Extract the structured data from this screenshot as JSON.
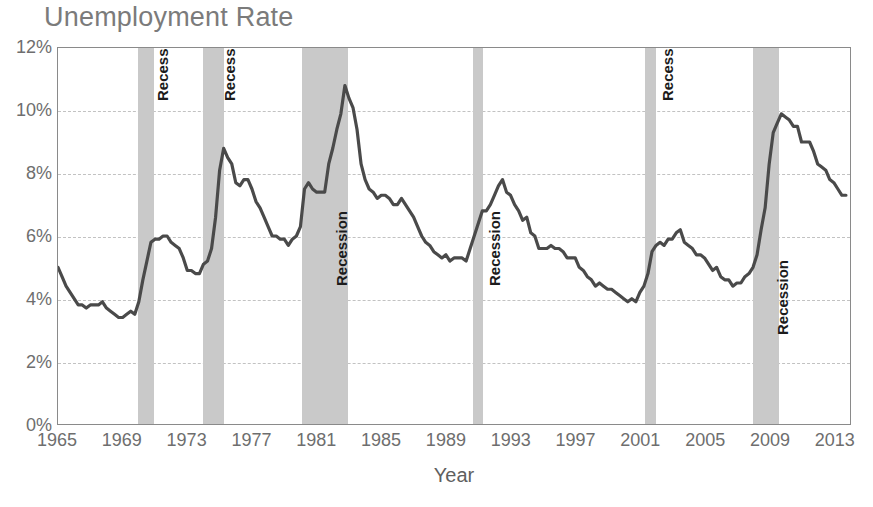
{
  "chart_data": {
    "type": "line",
    "title": "Unemployment Rate",
    "xlabel": "Year",
    "ylabel": "",
    "xlim": [
      1965,
      2014
    ],
    "ylim": [
      0,
      12
    ],
    "grid": true,
    "legend": "none",
    "y_tick_labels": [
      "0%",
      "2%",
      "4%",
      "6%",
      "8%",
      "10%",
      "12%"
    ],
    "y_tick_values": [
      0,
      2,
      4,
      6,
      8,
      10,
      12
    ],
    "x_tick_labels": [
      "1965",
      "1969",
      "1973",
      "1977",
      "1981",
      "1985",
      "1989",
      "1993",
      "1997",
      "2001",
      "2005",
      "2009",
      "2013"
    ],
    "x_tick_values": [
      1965,
      1969,
      1973,
      1977,
      1981,
      1985,
      1989,
      1993,
      1997,
      2001,
      2005,
      2009,
      2013
    ],
    "series": [
      {
        "name": "Unemployment Rate",
        "color": "#4a4a4a",
        "units": "percent",
        "x": [
          1965.0,
          1965.25,
          1965.5,
          1965.75,
          1966.0,
          1966.25,
          1966.5,
          1966.75,
          1967.0,
          1967.25,
          1967.5,
          1967.75,
          1968.0,
          1968.25,
          1968.5,
          1968.75,
          1969.0,
          1969.25,
          1969.5,
          1969.75,
          1970.0,
          1970.25,
          1970.5,
          1970.75,
          1971.0,
          1971.25,
          1971.5,
          1971.75,
          1972.0,
          1972.25,
          1972.5,
          1972.75,
          1973.0,
          1973.25,
          1973.5,
          1973.75,
          1974.0,
          1974.25,
          1974.5,
          1974.75,
          1975.0,
          1975.25,
          1975.5,
          1975.75,
          1976.0,
          1976.25,
          1976.5,
          1976.75,
          1977.0,
          1977.25,
          1977.5,
          1977.75,
          1978.0,
          1978.25,
          1978.5,
          1978.75,
          1979.0,
          1979.25,
          1979.5,
          1979.75,
          1980.0,
          1980.25,
          1980.5,
          1980.75,
          1981.0,
          1981.25,
          1981.5,
          1981.75,
          1982.0,
          1982.25,
          1982.5,
          1982.75,
          1983.0,
          1983.25,
          1983.5,
          1983.75,
          1984.0,
          1984.25,
          1984.5,
          1984.75,
          1985.0,
          1985.25,
          1985.5,
          1985.75,
          1986.0,
          1986.25,
          1986.5,
          1986.75,
          1987.0,
          1987.25,
          1987.5,
          1987.75,
          1988.0,
          1988.25,
          1988.5,
          1988.75,
          1989.0,
          1989.25,
          1989.5,
          1989.75,
          1990.0,
          1990.25,
          1990.5,
          1990.75,
          1991.0,
          1991.25,
          1991.5,
          1991.75,
          1992.0,
          1992.25,
          1992.5,
          1992.75,
          1993.0,
          1993.25,
          1993.5,
          1993.75,
          1994.0,
          1994.25,
          1994.5,
          1994.75,
          1995.0,
          1995.25,
          1995.5,
          1995.75,
          1996.0,
          1996.25,
          1996.5,
          1996.75,
          1997.0,
          1997.25,
          1997.5,
          1997.75,
          1998.0,
          1998.25,
          1998.5,
          1998.75,
          1999.0,
          1999.25,
          1999.5,
          1999.75,
          2000.0,
          2000.25,
          2000.5,
          2000.75,
          2001.0,
          2001.25,
          2001.5,
          2001.75,
          2002.0,
          2002.25,
          2002.5,
          2002.75,
          2003.0,
          2003.25,
          2003.5,
          2003.75,
          2004.0,
          2004.25,
          2004.5,
          2004.75,
          2005.0,
          2005.25,
          2005.5,
          2005.75,
          2006.0,
          2006.25,
          2006.5,
          2006.75,
          2007.0,
          2007.25,
          2007.5,
          2007.75,
          2008.0,
          2008.25,
          2008.5,
          2008.75,
          2009.0,
          2009.25,
          2009.5,
          2009.75,
          2010.0,
          2010.25,
          2010.5,
          2010.75,
          2011.0,
          2011.25,
          2011.5,
          2011.75,
          2012.0,
          2012.25,
          2012.5,
          2012.75,
          2013.0,
          2013.25,
          2013.5,
          2013.75
        ],
        "y": [
          5.0,
          4.7,
          4.4,
          4.2,
          4.0,
          3.8,
          3.8,
          3.7,
          3.8,
          3.8,
          3.8,
          3.9,
          3.7,
          3.6,
          3.5,
          3.4,
          3.4,
          3.5,
          3.6,
          3.5,
          3.9,
          4.6,
          5.2,
          5.8,
          5.9,
          5.9,
          6.0,
          6.0,
          5.8,
          5.7,
          5.6,
          5.3,
          4.9,
          4.9,
          4.8,
          4.8,
          5.1,
          5.2,
          5.6,
          6.6,
          8.1,
          8.8,
          8.5,
          8.3,
          7.7,
          7.6,
          7.8,
          7.8,
          7.5,
          7.1,
          6.9,
          6.6,
          6.3,
          6.0,
          6.0,
          5.9,
          5.9,
          5.7,
          5.9,
          6.0,
          6.3,
          7.5,
          7.7,
          7.5,
          7.4,
          7.4,
          7.4,
          8.3,
          8.8,
          9.4,
          9.9,
          10.8,
          10.4,
          10.1,
          9.4,
          8.3,
          7.8,
          7.5,
          7.4,
          7.2,
          7.3,
          7.3,
          7.2,
          7.0,
          7.0,
          7.2,
          7.0,
          6.8,
          6.6,
          6.3,
          6.0,
          5.8,
          5.7,
          5.5,
          5.4,
          5.3,
          5.4,
          5.2,
          5.3,
          5.3,
          5.3,
          5.2,
          5.6,
          6.0,
          6.4,
          6.8,
          6.8,
          7.0,
          7.3,
          7.6,
          7.8,
          7.4,
          7.3,
          7.0,
          6.8,
          6.5,
          6.6,
          6.1,
          6.0,
          5.6,
          5.6,
          5.6,
          5.7,
          5.6,
          5.6,
          5.5,
          5.3,
          5.3,
          5.3,
          5.0,
          4.9,
          4.7,
          4.6,
          4.4,
          4.5,
          4.4,
          4.3,
          4.3,
          4.2,
          4.1,
          4.0,
          3.9,
          4.0,
          3.9,
          4.2,
          4.4,
          4.8,
          5.5,
          5.7,
          5.8,
          5.7,
          5.9,
          5.9,
          6.1,
          6.2,
          5.8,
          5.7,
          5.6,
          5.4,
          5.4,
          5.3,
          5.1,
          4.9,
          5.0,
          4.7,
          4.6,
          4.6,
          4.4,
          4.5,
          4.5,
          4.7,
          4.8,
          5.0,
          5.4,
          6.2,
          6.9,
          8.3,
          9.3,
          9.6,
          9.9,
          9.8,
          9.7,
          9.5,
          9.5,
          9.0,
          9.0,
          9.0,
          8.7,
          8.3,
          8.2,
          8.1,
          7.8,
          7.7,
          7.5,
          7.3,
          7.3
        ]
      }
    ],
    "recessions": [
      {
        "label": "Recession",
        "start": 1969.92,
        "end": 1970.92,
        "label_top_pct": 14
      },
      {
        "label": "Recession",
        "start": 1973.92,
        "end": 1975.25,
        "label_top_pct": 14
      },
      {
        "label": "Recession",
        "start": 1980.08,
        "end": 1982.92,
        "label_top_pct": 63
      },
      {
        "label": "Recession",
        "start": 1990.58,
        "end": 1991.25,
        "label_top_pct": 63
      },
      {
        "label": "Recession",
        "start": 2001.25,
        "end": 2001.92,
        "label_top_pct": 14
      },
      {
        "label": "Recession",
        "start": 2007.92,
        "end": 2009.5,
        "label_top_pct": 76
      }
    ],
    "colors": {
      "line": "#4a4a4a",
      "recession_band": "#c9c9c9",
      "gridline": "#c2c2c2",
      "axis": "#8a8a8a",
      "title_text": "#7b7b7b",
      "tick_text": "#6e6e6e",
      "background": "#ffffff"
    }
  }
}
